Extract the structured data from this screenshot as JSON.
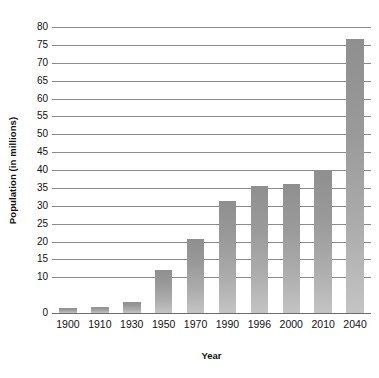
{
  "chart_data": {
    "type": "bar",
    "title": "",
    "subtitle": "",
    "xlabel": "Year",
    "ylabel": "Population (in millions)",
    "categories": [
      "1900",
      "1910",
      "1930",
      "1950",
      "1970",
      "1990",
      "1996",
      "2000",
      "2010",
      "2040"
    ],
    "values": [
      1.5,
      1.8,
      3.0,
      12.1,
      20.7,
      31.2,
      35.6,
      36.1,
      39.9,
      76.7
    ],
    "series": [
      {
        "name": "Population",
        "values": [
          1.5,
          1.8,
          3.0,
          12.1,
          20.7,
          31.2,
          35.6,
          36.1,
          39.9,
          76.7
        ]
      }
    ],
    "ylim": [
      0,
      80
    ],
    "y_ticks": [
      0,
      10,
      15,
      20,
      25,
      30,
      35,
      40,
      45,
      50,
      55,
      60,
      65,
      70,
      75,
      80
    ],
    "y_tick_labels": [
      "0",
      "10",
      "15",
      "20",
      "25",
      "30",
      "35",
      "40",
      "45",
      "50",
      "55",
      "60",
      "65",
      "70",
      "75",
      "80"
    ],
    "grid": "horizontal",
    "legend": "none",
    "bar_color_top": "#8f8f8f",
    "bar_color_bottom": "#c4c4c4",
    "gridline_color": "#8a8a8a",
    "axis_color": "#6d6d6d",
    "background_color": "#ffffff"
  }
}
